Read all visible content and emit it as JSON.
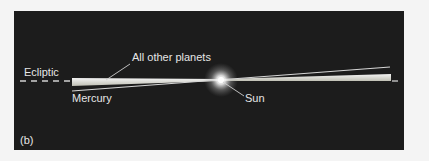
{
  "figure": {
    "panel_label": "(b)",
    "labels": {
      "ecliptic": "Ecliptic",
      "other_planets": "All other planets",
      "mercury": "Mercury",
      "sun": "Sun"
    },
    "colors": {
      "background": "#f4f4f4",
      "panel": "#1c1c1c",
      "text": "#e6e6e6",
      "planet_band": "#f0f0e8",
      "mercury_orbit": "#cfcfcf",
      "sun_glow": "#ffffff"
    }
  }
}
